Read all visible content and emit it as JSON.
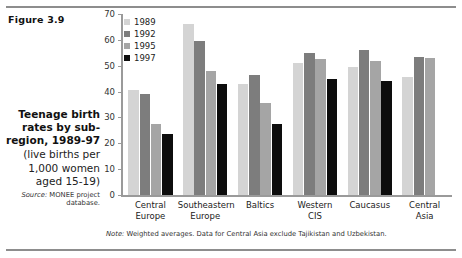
{
  "figure": {
    "number_label": "Figure 3.9",
    "caption_title": "Teenage birth rates by sub-region, 1989-97",
    "caption_subtitle": "(live births per 1,000 women aged 15-19)",
    "source_label": "Source:",
    "source_text": "MONEE project database.",
    "note_label": "Note:",
    "note_text": "Weighted averages. Data for Central Asia exclude Tajikistan and Uzbekistan."
  },
  "chart_data": {
    "type": "bar",
    "title": "Teenage birth rates by sub-region, 1989-97",
    "subtitle": "(live births per 1,000 women aged 15-19)",
    "xlabel": "",
    "ylabel": "",
    "ylim": [
      0,
      70
    ],
    "yticks": [
      0,
      10,
      20,
      30,
      40,
      50,
      60,
      70
    ],
    "ytick_labels": [
      "0",
      "10",
      "20",
      "30",
      "40",
      "50",
      "60",
      "70"
    ],
    "grid": false,
    "legend_position": "top-left",
    "categories": [
      "Central Europe",
      "Southeastern Europe",
      "Baltics",
      "Western CIS",
      "Caucasus",
      "Central Asia"
    ],
    "category_lines": [
      [
        "Central",
        "Europe"
      ],
      [
        "Southeastern",
        "Europe"
      ],
      [
        "Baltics",
        ""
      ],
      [
        "Western",
        "CIS"
      ],
      [
        "Caucasus",
        ""
      ],
      [
        "Central",
        "Asia"
      ]
    ],
    "series": [
      {
        "name": "1989",
        "color": "#d4d4d4",
        "values": [
          40.5,
          66.0,
          43.0,
          51.0,
          49.5,
          45.5
        ]
      },
      {
        "name": "1992",
        "color": "#7d7d7d",
        "values": [
          39.0,
          59.5,
          46.5,
          55.0,
          56.0,
          53.5
        ]
      },
      {
        "name": "1995",
        "color": "#a5a5a5",
        "values": [
          27.5,
          48.0,
          35.5,
          52.5,
          52.0,
          53.0
        ]
      },
      {
        "name": "1997",
        "color": "#0d0d0d",
        "values": [
          23.5,
          43.0,
          27.5,
          45.0,
          44.0,
          null
        ]
      }
    ]
  },
  "colors": {
    "axis": "#9a9a9a",
    "rule": "#8d8d8d",
    "text": "#222222",
    "background": "#ffffff"
  }
}
